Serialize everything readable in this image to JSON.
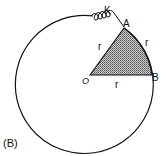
{
  "figure": {
    "caption": "(B)",
    "labels": {
      "center": "O",
      "point_a": "A",
      "point_b": "B",
      "spring": "K",
      "radius_oa": "r",
      "radius_ob": "r",
      "arc_ab": "r"
    },
    "colors": {
      "stroke": "#111111",
      "shade": "#9a9a9a",
      "background": "#ffffff"
    }
  }
}
